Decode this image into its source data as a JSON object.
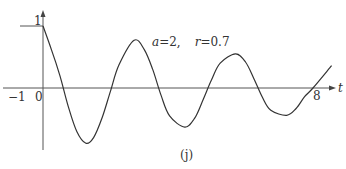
{
  "chart_data": {
    "type": "line",
    "title": "",
    "caption": "(j)",
    "annotation": "a=2,   r=0.7",
    "annotation_parts": {
      "a": "a",
      "a_val": "=2,",
      "r": "r",
      "r_val": "=0.7"
    },
    "xlabel": "t",
    "ylabel": "",
    "x_tick_labels": [
      "−1",
      "0",
      "8"
    ],
    "y_tick_labels": [
      "1"
    ],
    "xlim": [
      -1,
      8.6
    ],
    "ylim": [
      -1,
      1.25
    ],
    "grid": false,
    "legend": null,
    "series": [
      {
        "name": "damped oscillation",
        "x": [
          0,
          0.25,
          0.5,
          0.75,
          1.0,
          1.27,
          1.5,
          1.75,
          2.0,
          2.25,
          2.7,
          3.0,
          3.25,
          3.5,
          3.75,
          4.2,
          4.5,
          4.75,
          5.0,
          5.25,
          5.7,
          6.0,
          6.25,
          6.5,
          6.75,
          7.22,
          7.5,
          7.75,
          8.0,
          8.55
        ],
        "values": [
          1.0,
          0.62,
          0.2,
          -0.3,
          -0.7,
          -0.89,
          -0.8,
          -0.48,
          -0.05,
          0.37,
          0.77,
          0.62,
          0.3,
          -0.12,
          -0.45,
          -0.63,
          -0.48,
          -0.18,
          0.14,
          0.4,
          0.55,
          0.42,
          0.15,
          -0.15,
          -0.36,
          -0.44,
          -0.33,
          -0.14,
          0.0,
          0.36
        ]
      }
    ]
  },
  "labels": {
    "y_one": "1",
    "x_minus_one": "−1",
    "x_zero": "0",
    "x_eight": "8",
    "t_axis": "t",
    "caption": "(j)",
    "param_a": "a",
    "param_a_val": "=2,",
    "param_r": "r",
    "param_r_val": "=0.7"
  }
}
